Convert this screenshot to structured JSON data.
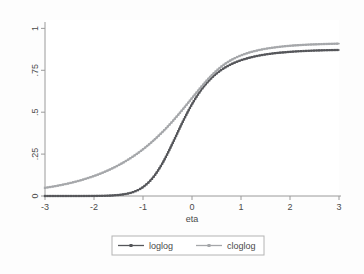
{
  "figure": {
    "background_color": "#fdfdfd",
    "plot_region_color": "#ffffff",
    "axis_color": "#9a9a9a",
    "text_color": "#4a4a4a",
    "legend_border_color": "#b4b4b4"
  },
  "chart_data": {
    "type": "line",
    "title": "",
    "subtitle": "",
    "xlabel": "eta",
    "ylabel": "",
    "xlim": [
      -3,
      3
    ],
    "ylim": [
      0,
      1.05
    ],
    "grid": false,
    "legend_position": "bottom",
    "xticks": [
      -3,
      -2,
      -1,
      0,
      1,
      2,
      3
    ],
    "xticklabels": [
      "-3",
      "-2",
      "-1",
      "0",
      "1",
      "2",
      "3"
    ],
    "yticks": [
      0,
      0.25,
      0.5,
      0.75,
      1
    ],
    "yticklabels": [
      "0",
      ".25",
      ".5",
      ".75",
      "1"
    ],
    "x": [
      -3,
      -2.8,
      -2.6,
      -2.4,
      -2.2,
      -2,
      -1.8,
      -1.6,
      -1.4,
      -1.2,
      -1,
      -0.8,
      -0.6,
      -0.4,
      -0.2,
      0,
      0.2,
      0.4,
      0.6,
      0.8,
      1,
      1.2,
      1.4,
      1.6,
      1.8,
      2,
      2.2,
      2.4,
      2.6,
      2.8,
      3
    ],
    "series": [
      {
        "name": "loglog",
        "color": "#55565a",
        "marker": "square",
        "values": [
          0.0,
          0.0,
          0.0,
          0.0,
          0.0001,
          0.0005,
          0.0014,
          0.0038,
          0.0097,
          0.0234,
          0.053,
          0.1084,
          0.1969,
          0.3122,
          0.4359,
          0.5477,
          0.6376,
          0.7045,
          0.7524,
          0.7862,
          0.81,
          0.827,
          0.8394,
          0.8485,
          0.8552,
          0.8601,
          0.8638,
          0.8665,
          0.8686,
          0.8701,
          0.8712
        ]
      },
      {
        "name": "cloglog",
        "color": "#a5a7aa",
        "marker": "square",
        "values": [
          0.0486,
          0.0583,
          0.07,
          0.0837,
          0.1,
          0.1193,
          0.142,
          0.1687,
          0.2,
          0.2365,
          0.2788,
          0.3274,
          0.3827,
          0.4447,
          0.5126,
          0.5841,
          0.6551,
          0.7197,
          0.7725,
          0.8113,
          0.8389,
          0.8585,
          0.8727,
          0.883,
          0.8906,
          0.8962,
          0.9003,
          0.9034,
          0.9057,
          0.9075,
          0.9088
        ]
      }
    ],
    "legend_entries": [
      {
        "label": "loglog",
        "color": "#55565a"
      },
      {
        "label": "cloglog",
        "color": "#a5a7aa"
      }
    ]
  }
}
